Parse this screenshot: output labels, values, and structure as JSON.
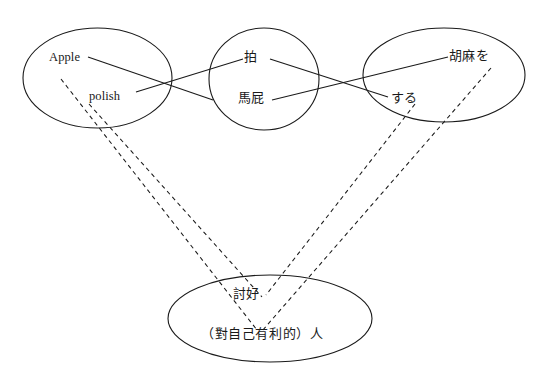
{
  "diagram": {
    "type": "concept-mapping-diagram",
    "background_color": "#ffffff",
    "stroke_color": "#1a1a1a",
    "nodes": [
      {
        "id": "english",
        "shape": "ellipse",
        "labels": [
          {
            "id": "apple",
            "text": "Apple",
            "script": "latin"
          },
          {
            "id": "polish",
            "text": "polish",
            "script": "latin"
          }
        ]
      },
      {
        "id": "chinese",
        "shape": "ellipse",
        "labels": [
          {
            "id": "pai",
            "text": "拍",
            "script": "cjk"
          },
          {
            "id": "mapi",
            "text": "馬屁",
            "script": "cjk"
          }
        ]
      },
      {
        "id": "japanese",
        "shape": "ellipse",
        "labels": [
          {
            "id": "gomawo",
            "text": "胡麻を",
            "script": "cjk"
          },
          {
            "id": "suru",
            "text": "する",
            "script": "cjk"
          }
        ]
      },
      {
        "id": "meaning",
        "shape": "ellipse",
        "labels": [
          {
            "id": "taohao",
            "text": "討好",
            "script": "cjk"
          },
          {
            "id": "beneficiary",
            "text": "（對自己有利的）人",
            "script": "cjk"
          }
        ]
      }
    ],
    "solid_edges": [
      {
        "from": "apple",
        "to": "mapi"
      },
      {
        "from": "polish",
        "to": "pai"
      },
      {
        "from": "pai",
        "to": "suru"
      },
      {
        "from": "mapi",
        "to": "gomawo"
      }
    ],
    "dashed_edges": [
      {
        "from": "apple",
        "to": "meaning"
      },
      {
        "from": "polish",
        "to": "meaning"
      },
      {
        "from": "suru",
        "to": "meaning"
      },
      {
        "from": "gomawo",
        "to": "meaning"
      }
    ]
  },
  "labels": {
    "apple": "Apple",
    "polish": "polish",
    "pai": "拍",
    "mapi": "馬屁",
    "gomawo": "胡麻を",
    "suru": "する",
    "taohao": "討好",
    "beneficiary": "（對自己有利的）人"
  }
}
